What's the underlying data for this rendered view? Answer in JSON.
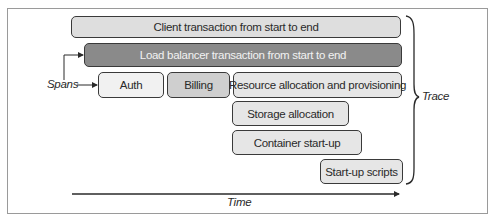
{
  "diagram": {
    "spans": [
      {
        "id": "client",
        "label": "Client transaction from start to end",
        "fill": "#dedede",
        "text_color": "#2a2a2a"
      },
      {
        "id": "load-balancer",
        "label": "Load balancer transaction from start to end",
        "fill": "#8a8a8a",
        "text_color": "#f2f2f2"
      },
      {
        "id": "auth",
        "label": "Auth",
        "fill": "#f1f1f1",
        "text_color": "#2a2a2a"
      },
      {
        "id": "billing",
        "label": "Billing",
        "fill": "#cfcfcf",
        "text_color": "#2a2a2a"
      },
      {
        "id": "resource",
        "label": "Resource allocation and provisioning",
        "fill": "#e6e6e6",
        "text_color": "#2a2a2a"
      },
      {
        "id": "storage",
        "label": "Storage allocation",
        "fill": "#e6e6e6",
        "text_color": "#2a2a2a"
      },
      {
        "id": "container",
        "label": "Container start-up",
        "fill": "#e6e6e6",
        "text_color": "#2a2a2a"
      },
      {
        "id": "scripts",
        "label": "Start-up scripts",
        "fill": "#e6e6e6",
        "text_color": "#2a2a2a"
      }
    ],
    "annotations": {
      "spans_label": "Spans",
      "trace_label": "Trace",
      "time_label": "Time"
    },
    "colors": {
      "border": "#3a3a3a",
      "frame": "#9a9a9a",
      "arrow": "#2a2a2a"
    }
  }
}
